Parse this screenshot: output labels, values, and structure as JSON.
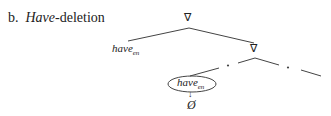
{
  "title": {
    "prefix": "b.",
    "italic": "Have",
    "rest": "-deletion"
  },
  "tree": {
    "root_symbol": "∇",
    "inner_symbol": "∇",
    "left_leaf": {
      "base": "have",
      "sub": "en"
    },
    "circled_leaf": {
      "base": "have",
      "sub": "en"
    },
    "deleted_symbol": "Ø",
    "arrow": "↓",
    "dot": "•"
  }
}
